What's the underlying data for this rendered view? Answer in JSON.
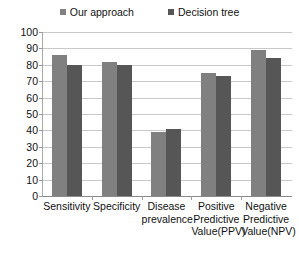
{
  "chart_data": {
    "type": "bar",
    "title": "",
    "subtitle": "",
    "xlabel": "",
    "ylabel": "",
    "ylim": [
      0,
      100
    ],
    "yticks": [
      0,
      10,
      20,
      30,
      40,
      50,
      60,
      70,
      80,
      90,
      100
    ],
    "grid": true,
    "legend_position": "top-center",
    "categories": [
      "Sensitivity",
      "Specificity",
      "Disease prevalence",
      "Positive Predictive Value(PPV)",
      "Negative Predictive Value(NPV)"
    ],
    "category_lines": [
      [
        "Sensitivity"
      ],
      [
        "Specificity"
      ],
      [
        "Disease",
        "prevalence"
      ],
      [
        "Positive",
        "Predictive",
        "Value(PPV)"
      ],
      [
        "Negative",
        "Predictive",
        "Value(NPV)"
      ]
    ],
    "series": [
      {
        "name": "Our approach",
        "color": "#808080",
        "values": [
          86,
          82,
          39,
          75,
          89
        ]
      },
      {
        "name": "Decision tree",
        "color": "#565656",
        "values": [
          80,
          80,
          41,
          73,
          84
        ]
      }
    ]
  },
  "legend": {
    "items": [
      {
        "label": "Our approach",
        "color": "#808080"
      },
      {
        "label": "Decision tree",
        "color": "#565656"
      }
    ]
  },
  "axis": {
    "y_tick_labels": [
      "100",
      "90",
      "80",
      "70",
      "60",
      "50",
      "40",
      "30",
      "20",
      "10",
      "0"
    ]
  }
}
